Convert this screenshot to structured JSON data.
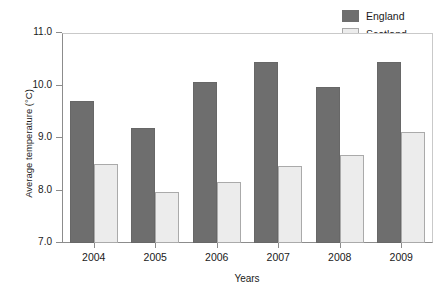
{
  "chart_data": {
    "type": "bar",
    "title": "",
    "xlabel": "Years",
    "ylabel": "Average temperature (°C)",
    "categories": [
      "2004",
      "2005",
      "2006",
      "2007",
      "2008",
      "2009"
    ],
    "series": [
      {
        "name": "England",
        "color": "#6e6e6e",
        "values": [
          9.7,
          9.2,
          10.07,
          10.45,
          9.97,
          10.44
        ]
      },
      {
        "name": "Scotland",
        "color": "#ececec",
        "values": [
          8.51,
          7.98,
          8.17,
          8.46,
          8.67,
          9.12
        ]
      }
    ],
    "ylim": [
      7.0,
      11.0
    ],
    "yticks": [
      "7.0",
      "8.0",
      "9.0",
      "10.0",
      "11.0"
    ],
    "ytick_values": [
      7.0,
      8.0,
      9.0,
      10.0,
      11.0
    ],
    "grid": false,
    "legend_position": "top-right"
  },
  "legend": {
    "items": [
      {
        "label": "England",
        "swatch": "dark-gray-swatch"
      },
      {
        "label": "Scotland",
        "swatch": "light-gray-swatch"
      }
    ]
  },
  "axes": {
    "y_title": "Average temperature (°C)",
    "x_title": "Years"
  }
}
